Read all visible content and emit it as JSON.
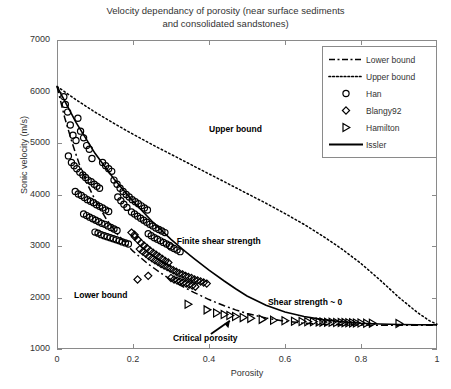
{
  "chart_data": {
    "type": "scatter",
    "title": "Velocity dependancy of porosity (near surface sediments and consolidated sandstones)",
    "title_line1": "Velocity dependancy of porosity (near surface sediments",
    "title_line2": "and consolidated sandstones)",
    "xlabel": "Porosity",
    "ylabel": "Sonic velocity (m/s)",
    "xlim": [
      0,
      1
    ],
    "ylim": [
      1000,
      7000
    ],
    "xticks": [
      0,
      0.2,
      0.4,
      0.6,
      0.8,
      1
    ],
    "xticklabels": [
      "0",
      "0.2",
      "0.4",
      "0.6",
      "0.8",
      "1"
    ],
    "yticks": [
      1000,
      2000,
      3000,
      4000,
      5000,
      6000,
      7000
    ],
    "yticklabels": [
      "1000",
      "2000",
      "3000",
      "4000",
      "5000",
      "6000",
      "7000"
    ],
    "grid": false,
    "legend_position": "top-right",
    "series": [
      {
        "name": "Lower bound",
        "type": "line",
        "linestyle": "dashdot",
        "color": "#000000",
        "points": [
          [
            0.0,
            6100
          ],
          [
            0.02,
            5500
          ],
          [
            0.04,
            5000
          ],
          [
            0.06,
            4560
          ],
          [
            0.08,
            4200
          ],
          [
            0.1,
            3900
          ],
          [
            0.13,
            3520
          ],
          [
            0.16,
            3220
          ],
          [
            0.2,
            2900
          ],
          [
            0.24,
            2650
          ],
          [
            0.28,
            2440
          ],
          [
            0.32,
            2255
          ],
          [
            0.36,
            2100
          ],
          [
            0.4,
            1960
          ],
          [
            0.44,
            1840
          ],
          [
            0.47,
            1760
          ],
          [
            0.5,
            1690
          ],
          [
            0.55,
            1600
          ],
          [
            0.6,
            1540
          ],
          [
            0.65,
            1500
          ],
          [
            0.7,
            1480
          ],
          [
            0.8,
            1465
          ],
          [
            0.9,
            1460
          ],
          [
            1.0,
            1460
          ]
        ]
      },
      {
        "name": "Upper bound",
        "type": "line",
        "linestyle": "dotted",
        "color": "#000000",
        "points": [
          [
            0.0,
            6100
          ],
          [
            0.05,
            5840
          ],
          [
            0.1,
            5600
          ],
          [
            0.15,
            5380
          ],
          [
            0.2,
            5170
          ],
          [
            0.25,
            4970
          ],
          [
            0.3,
            4780
          ],
          [
            0.35,
            4590
          ],
          [
            0.4,
            4400
          ],
          [
            0.45,
            4210
          ],
          [
            0.5,
            4020
          ],
          [
            0.55,
            3830
          ],
          [
            0.6,
            3630
          ],
          [
            0.65,
            3420
          ],
          [
            0.7,
            3190
          ],
          [
            0.75,
            2940
          ],
          [
            0.8,
            2660
          ],
          [
            0.85,
            2340
          ],
          [
            0.9,
            2000
          ],
          [
            0.95,
            1700
          ],
          [
            0.98,
            1550
          ],
          [
            1.0,
            1480
          ]
        ]
      },
      {
        "name": "Issler",
        "type": "line",
        "linestyle": "solid",
        "color": "#000000",
        "points": [
          [
            0.0,
            6100
          ],
          [
            0.05,
            5400
          ],
          [
            0.1,
            4800
          ],
          [
            0.15,
            4300
          ],
          [
            0.2,
            3870
          ],
          [
            0.25,
            3480
          ],
          [
            0.3,
            3130
          ],
          [
            0.33,
            2940
          ],
          [
            0.36,
            2760
          ],
          [
            0.4,
            2530
          ],
          [
            0.44,
            2320
          ],
          [
            0.47,
            2170
          ],
          [
            0.5,
            2030
          ],
          [
            0.55,
            1850
          ],
          [
            0.6,
            1720
          ],
          [
            0.65,
            1630
          ],
          [
            0.7,
            1570
          ],
          [
            0.75,
            1530
          ],
          [
            0.8,
            1500
          ],
          [
            0.85,
            1485
          ],
          [
            0.9,
            1475
          ],
          [
            0.95,
            1470
          ],
          [
            1.0,
            1468
          ]
        ]
      },
      {
        "name": "Han",
        "type": "scatter",
        "marker": "circle",
        "color": "#000000",
        "points": [
          [
            0.035,
            5350
          ],
          [
            0.042,
            5150
          ],
          [
            0.05,
            5050
          ],
          [
            0.055,
            5480
          ],
          [
            0.062,
            5230
          ],
          [
            0.07,
            5100
          ],
          [
            0.078,
            4950
          ],
          [
            0.085,
            4880
          ],
          [
            0.03,
            4750
          ],
          [
            0.038,
            4620
          ],
          [
            0.045,
            4560
          ],
          [
            0.052,
            4500
          ],
          [
            0.06,
            4430
          ],
          [
            0.068,
            4380
          ],
          [
            0.075,
            4330
          ],
          [
            0.082,
            4280
          ],
          [
            0.09,
            4250
          ],
          [
            0.098,
            4200
          ],
          [
            0.105,
            4160
          ],
          [
            0.112,
            4120
          ],
          [
            0.048,
            4060
          ],
          [
            0.056,
            4010
          ],
          [
            0.064,
            3980
          ],
          [
            0.072,
            3940
          ],
          [
            0.08,
            3900
          ],
          [
            0.088,
            3870
          ],
          [
            0.096,
            3840
          ],
          [
            0.104,
            3800
          ],
          [
            0.112,
            3770
          ],
          [
            0.12,
            3740
          ],
          [
            0.128,
            3700
          ],
          [
            0.136,
            3670
          ],
          [
            0.07,
            3620
          ],
          [
            0.078,
            3590
          ],
          [
            0.086,
            3560
          ],
          [
            0.094,
            3530
          ],
          [
            0.102,
            3500
          ],
          [
            0.11,
            3470
          ],
          [
            0.118,
            3440
          ],
          [
            0.126,
            3420
          ],
          [
            0.134,
            3390
          ],
          [
            0.142,
            3360
          ],
          [
            0.15,
            3330
          ],
          [
            0.158,
            3300
          ],
          [
            0.1,
            3270
          ],
          [
            0.108,
            3250
          ],
          [
            0.116,
            3220
          ],
          [
            0.124,
            3200
          ],
          [
            0.132,
            3180
          ],
          [
            0.14,
            3160
          ],
          [
            0.148,
            3140
          ],
          [
            0.156,
            3120
          ],
          [
            0.164,
            3100
          ],
          [
            0.172,
            3080
          ],
          [
            0.18,
            3060
          ],
          [
            0.188,
            3040
          ],
          [
            0.15,
            4280
          ],
          [
            0.158,
            4200
          ],
          [
            0.166,
            4120
          ],
          [
            0.174,
            4060
          ],
          [
            0.182,
            4000
          ],
          [
            0.19,
            3950
          ],
          [
            0.198,
            3900
          ],
          [
            0.206,
            3860
          ],
          [
            0.214,
            3820
          ],
          [
            0.222,
            3780
          ],
          [
            0.23,
            3740
          ],
          [
            0.238,
            3700
          ],
          [
            0.196,
            3660
          ],
          [
            0.204,
            3620
          ],
          [
            0.212,
            3580
          ],
          [
            0.22,
            3540
          ],
          [
            0.228,
            3500
          ],
          [
            0.236,
            3460
          ],
          [
            0.244,
            3420
          ],
          [
            0.252,
            3390
          ],
          [
            0.26,
            3350
          ],
          [
            0.268,
            3320
          ],
          [
            0.276,
            3290
          ],
          [
            0.284,
            3260
          ],
          [
            0.12,
            4620
          ],
          [
            0.128,
            4560
          ],
          [
            0.136,
            4500
          ],
          [
            0.144,
            4450
          ],
          [
            0.022,
            5750
          ],
          [
            0.028,
            5600
          ],
          [
            0.018,
            5900
          ],
          [
            0.092,
            4700
          ],
          [
            0.16,
            3950
          ],
          [
            0.168,
            3880
          ],
          [
            0.176,
            3810
          ],
          [
            0.184,
            3750
          ],
          [
            0.24,
            3240
          ],
          [
            0.248,
            3200
          ],
          [
            0.256,
            3160
          ],
          [
            0.264,
            3130
          ],
          [
            0.272,
            3100
          ],
          [
            0.28,
            3070
          ],
          [
            0.288,
            3040
          ],
          [
            0.296,
            3010
          ],
          [
            0.3,
            2980
          ],
          [
            0.308,
            2950
          ],
          [
            0.316,
            2920
          ],
          [
            0.324,
            2890
          ]
        ]
      },
      {
        "name": "Blangy92",
        "type": "scatter",
        "marker": "diamond",
        "color": "#000000",
        "points": [
          [
            0.205,
            3180
          ],
          [
            0.213,
            3120
          ],
          [
            0.221,
            3060
          ],
          [
            0.229,
            3010
          ],
          [
            0.237,
            2960
          ],
          [
            0.245,
            2910
          ],
          [
            0.253,
            2870
          ],
          [
            0.261,
            2830
          ],
          [
            0.269,
            2790
          ],
          [
            0.277,
            2750
          ],
          [
            0.285,
            2710
          ],
          [
            0.293,
            2680
          ],
          [
            0.218,
            2940
          ],
          [
            0.226,
            2890
          ],
          [
            0.234,
            2850
          ],
          [
            0.242,
            2800
          ],
          [
            0.25,
            2760
          ],
          [
            0.258,
            2720
          ],
          [
            0.266,
            2690
          ],
          [
            0.274,
            2650
          ],
          [
            0.282,
            2620
          ],
          [
            0.29,
            2590
          ],
          [
            0.298,
            2560
          ],
          [
            0.306,
            2530
          ],
          [
            0.314,
            2500
          ],
          [
            0.322,
            2470
          ],
          [
            0.33,
            2450
          ],
          [
            0.338,
            2420
          ],
          [
            0.346,
            2400
          ],
          [
            0.354,
            2380
          ],
          [
            0.362,
            2350
          ],
          [
            0.37,
            2330
          ],
          [
            0.378,
            2310
          ],
          [
            0.386,
            2290
          ],
          [
            0.394,
            2270
          ],
          [
            0.3,
            2380
          ],
          [
            0.308,
            2350
          ],
          [
            0.316,
            2330
          ],
          [
            0.324,
            2310
          ],
          [
            0.332,
            2290
          ],
          [
            0.34,
            2270
          ],
          [
            0.348,
            2250
          ],
          [
            0.356,
            2230
          ],
          [
            0.364,
            2210
          ],
          [
            0.24,
            2420
          ],
          [
            0.196,
            3260
          ],
          [
            0.204,
            3220
          ],
          [
            0.212,
            2350
          ]
        ]
      },
      {
        "name": "Hamilton",
        "type": "scatter",
        "marker": "triangle-right",
        "color": "#000000",
        "points": [
          [
            0.345,
            1870
          ],
          [
            0.395,
            1760
          ],
          [
            0.42,
            1700
          ],
          [
            0.44,
            1670
          ],
          [
            0.455,
            1650
          ],
          [
            0.47,
            1630
          ],
          [
            0.49,
            1610
          ],
          [
            0.51,
            1595
          ],
          [
            0.54,
            1575
          ],
          [
            0.57,
            1560
          ],
          [
            0.6,
            1548
          ],
          [
            0.625,
            1540
          ],
          [
            0.645,
            1535
          ],
          [
            0.66,
            1530
          ],
          [
            0.675,
            1528
          ],
          [
            0.69,
            1525
          ],
          [
            0.7,
            1522
          ],
          [
            0.712,
            1520
          ],
          [
            0.724,
            1518
          ],
          [
            0.736,
            1516
          ],
          [
            0.748,
            1514
          ],
          [
            0.758,
            1512
          ],
          [
            0.768,
            1510
          ],
          [
            0.778,
            1508
          ],
          [
            0.788,
            1506
          ],
          [
            0.8,
            1504
          ],
          [
            0.815,
            1502
          ],
          [
            0.83,
            1500
          ],
          [
            0.9,
            1495
          ]
        ]
      }
    ],
    "annotations": [
      {
        "text": "Upper bound",
        "x": 0.4,
        "y": 5250
      },
      {
        "text": "Lower bound",
        "x": 0.045,
        "y": 2030
      },
      {
        "text": "Finite shear strength",
        "x": 0.315,
        "y": 3080
      },
      {
        "text": "Shear strength ~ 0",
        "x": 0.555,
        "y": 1900
      },
      {
        "text": "Critical porosity",
        "x": 0.305,
        "y": 1190
      }
    ],
    "arrow": {
      "label": "Critical porosity",
      "from_x": 0.405,
      "from_y": 1290,
      "to_x": 0.455,
      "to_y": 1550
    }
  },
  "legend": {
    "entries": [
      {
        "label": "Lower bound",
        "key": "dashdot-line"
      },
      {
        "label": "Upper bound",
        "key": "dotted-line"
      },
      {
        "label": "Han",
        "key": "circle-marker"
      },
      {
        "label": "Blangy92",
        "key": "diamond-marker"
      },
      {
        "label": "Hamilton",
        "key": "triangle-marker"
      },
      {
        "label": "Issler",
        "key": "solid-line"
      }
    ]
  }
}
